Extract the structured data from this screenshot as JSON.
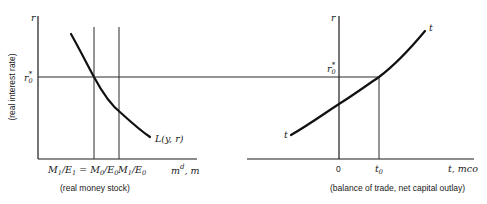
{
  "left_panel": {
    "y_axis_label": "r",
    "y_axis_caption": "(real interest rate)",
    "r_star_label": "r",
    "r_star_sub": "0",
    "r_star_sup": "*",
    "curve_label": "L(y, r)",
    "x_ticks": [
      {
        "main": "M",
        "sub1": "1",
        "slash": "/E",
        "sub2": "1",
        "eq": " = ",
        "main2": "M",
        "sub3": "0",
        "slash2": "/E",
        "sub4": "0"
      },
      {
        "main": "M",
        "sub1": "1",
        "slash": "/E",
        "sub2": "0"
      }
    ],
    "x_axis_label_main": "m",
    "x_axis_label_sup": "d",
    "x_axis_label_rest": ", m",
    "x_axis_caption": "(real money stock)"
  },
  "right_panel": {
    "y_axis_label": "r",
    "r_star_label": "r",
    "r_star_sub": "0",
    "r_star_sup": "*",
    "curve_label_top": "t",
    "curve_label_bottom": "t",
    "x_ticks": [
      {
        "label": "0"
      },
      {
        "main": "t",
        "sub": "0"
      }
    ],
    "x_axis_label": "t, mco",
    "x_axis_caption": "(balance of trade, net capital outlay)"
  }
}
